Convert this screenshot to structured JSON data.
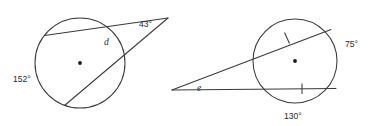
{
  "diagram": {
    "background_color": "#ffffff",
    "stroke_color": "#3a3a3a",
    "text_color": "#2b2b2b",
    "figures": [
      {
        "id": "left-figure",
        "description": "Circle with a chord and a secant meeting at an external vertex",
        "circle": {
          "cx": 80,
          "cy": 63,
          "r": 45
        },
        "external_vertex": {
          "x": 168,
          "y": 18
        },
        "labels": {
          "apex_angle": "43°",
          "arc_variable": "d",
          "far_arc": "152°"
        }
      },
      {
        "id": "right-figure",
        "description": "Circle with two secants from an external point, congruent chords marked with ticks",
        "circle": {
          "cx": 295,
          "cy": 61,
          "r": 42
        },
        "external_vertex": {
          "x": 172,
          "y": 90
        },
        "labels": {
          "vertex_angle": "e",
          "right_arc": "75°",
          "bottom_arc": "130°"
        },
        "tick_marks": 2
      }
    ]
  },
  "icons": {
    "center_dot": "circle-center-dot",
    "tick": "congruence-tick-mark"
  }
}
